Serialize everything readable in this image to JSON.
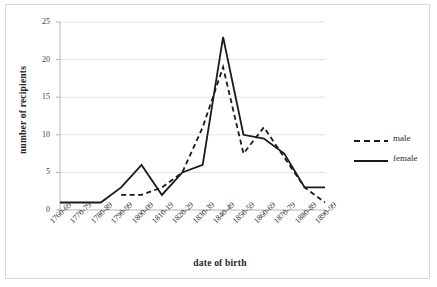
{
  "chart_data": {
    "type": "line",
    "title": "",
    "xlabel": "date of birth",
    "ylabel": "number of recipients",
    "categories": [
      "1760-69",
      "1770-79",
      "1780-89",
      "1790-99",
      "1800-09",
      "1810-19",
      "1820-29",
      "1830-39",
      "1840-49",
      "1850-59",
      "1860-69",
      "1870-79",
      "1880-89",
      "1890-99"
    ],
    "ylim": [
      0,
      25
    ],
    "y_ticks": [
      0,
      5,
      10,
      15,
      20,
      25
    ],
    "grid": "horizontal",
    "legend_position": "right",
    "series": [
      {
        "name": "male",
        "style": "dashed",
        "color": "#1a1a1a",
        "values": [
          null,
          null,
          null,
          2,
          2,
          3,
          5,
          11,
          19,
          7.5,
          11,
          7,
          3,
          1
        ]
      },
      {
        "name": "female",
        "style": "solid",
        "color": "#1a1a1a",
        "values": [
          1,
          1,
          1,
          3,
          6,
          2,
          5,
          6,
          23,
          10,
          9.5,
          7.5,
          3,
          3
        ]
      }
    ]
  },
  "axes": {
    "x_title": "date of birth",
    "y_title": "number of recipients"
  },
  "legend": {
    "items": [
      {
        "label": "male",
        "style": "dashed"
      },
      {
        "label": "female",
        "style": "solid"
      }
    ]
  }
}
